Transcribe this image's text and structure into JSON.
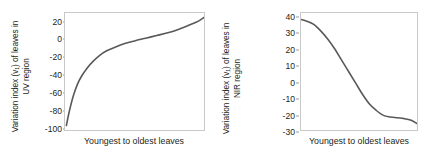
{
  "figure": {
    "panels": [
      {
        "id": "uv-panel",
        "ylabel_line1": "Variation index (v₁) of leaves in",
        "ylabel_line2": "UV region",
        "xlabel": "Youngest to oldest leaves",
        "curve_color": "#595959",
        "frame_color": "#c9c9c9"
      },
      {
        "id": "nir-panel",
        "ylabel_line1": "Variation index (v₁) of leaves in",
        "ylabel_line2": "NIR region",
        "xlabel": "Youngest to oldest leaves",
        "curve_color": "#595959",
        "frame_color": "#c9c9c9"
      }
    ]
  },
  "chart_data": [
    {
      "type": "line",
      "title": "",
      "xlabel": "Youngest to oldest leaves",
      "ylabel": "Variation index (v₁) of leaves in UV region",
      "ylim": [
        -100,
        30
      ],
      "xlim": [
        0,
        100
      ],
      "yticks": [
        20,
        0,
        -20,
        -40,
        -60,
        -80,
        -100
      ],
      "ytick_labels": [
        "20",
        "0",
        "-20",
        "-40",
        "-60",
        "-80",
        "-100"
      ],
      "xticks": [],
      "xtick_labels": [],
      "grid": false,
      "legend": null,
      "series": [
        {
          "name": "UV variation index",
          "x": [
            1,
            3,
            6,
            9,
            12,
            16,
            20,
            25,
            30,
            36,
            43,
            50,
            58,
            66,
            74,
            82,
            90,
            96,
            100
          ],
          "values": [
            -95,
            -80,
            -62,
            -49,
            -40,
            -31,
            -24,
            -17,
            -12,
            -8,
            -4,
            -1,
            2,
            5,
            8,
            12,
            17,
            21,
            25
          ]
        }
      ]
    },
    {
      "type": "line",
      "title": "",
      "xlabel": "Youngest to oldest leaves",
      "ylabel": "Variation index (v₁) of leaves in NIR region",
      "ylim": [
        -30,
        42
      ],
      "xlim": [
        0,
        100
      ],
      "yticks": [
        40,
        30,
        20,
        10,
        0,
        -10,
        -20,
        -30
      ],
      "ytick_labels": [
        "40",
        "30",
        "20",
        "10",
        "0",
        "-10",
        "-20",
        "-30"
      ],
      "xticks": [],
      "xtick_labels": [],
      "grid": false,
      "legend": null,
      "series": [
        {
          "name": "NIR variation index",
          "x": [
            0,
            5,
            11,
            17,
            23,
            29,
            35,
            41,
            47,
            53,
            59,
            65,
            71,
            77,
            83,
            89,
            95,
            100
          ],
          "values": [
            38,
            37,
            35,
            31,
            26,
            20,
            13,
            6,
            -1,
            -8,
            -14,
            -18,
            -21,
            -22,
            -22.5,
            -23,
            -24,
            -26
          ]
        }
      ]
    }
  ]
}
